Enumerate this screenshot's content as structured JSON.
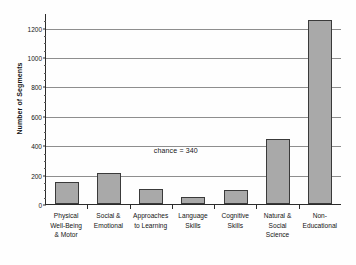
{
  "chart_data": {
    "type": "bar",
    "title": "",
    "xlabel": "",
    "ylabel": "Number of Segments",
    "ylim": [
      0,
      1300
    ],
    "grid": true,
    "legend": "none",
    "orientation": "vertical",
    "bar_color": "#a9a9a9",
    "bar_edge_color": "#3a3a3a",
    "categories": [
      "Physical Well-Being & Motor",
      "Social & Emotional",
      "Approaches to Learning",
      "Language Skills",
      "Cognitive Skills",
      "Natural & Social Science",
      "Non-Educational"
    ],
    "category_lines": [
      [
        "Physical",
        "Well-Being",
        "& Motor"
      ],
      [
        "Social &",
        "Emotional"
      ],
      [
        "Approaches",
        "to Learning"
      ],
      [
        "Language",
        "Skills"
      ],
      [
        "Cognitive",
        "Skills"
      ],
      [
        "Natural &",
        "Social",
        "Science"
      ],
      [
        "Non-",
        "Educational"
      ]
    ],
    "values": [
      150,
      210,
      100,
      50,
      97,
      440,
      1250
    ],
    "yticks": [
      0,
      200,
      400,
      600,
      800,
      1000,
      1200
    ],
    "ytick_labels": [
      "0",
      "200",
      "400",
      "600",
      "800",
      "1000",
      "1200"
    ],
    "annotations": [
      {
        "text": "chance = 340",
        "x_category_index": 2.55,
        "y_value": 360
      }
    ]
  }
}
